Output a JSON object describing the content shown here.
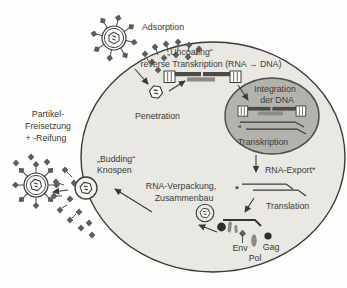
{
  "diagram": {
    "type": "retrovirus-replication-cycle",
    "labels": {
      "adsorption": "Adsorption",
      "uncoating": "„Uncoating“",
      "reverse_transcription": "reverse Transkription (RNA → DNA)",
      "penetration": "Penetration",
      "integration_line1": "Integration",
      "integration_line2": "der DNA",
      "transcription": "Transkription",
      "rna_export": "RNA-Export*",
      "translation": "Translation",
      "packaging_line1": "RNA-Verpackung,",
      "packaging_line2": "Zusammenbau",
      "budding_line1": "„Budding“",
      "budding_line2": "Knospen",
      "release_line1": "Partikel-",
      "release_line2": "Freisetzung",
      "release_line3": "+ -Reifung",
      "protein_env": "Env",
      "protein_pol": "Pol",
      "protein_gag": "Gag"
    },
    "colors": {
      "ink": "#3a3a38",
      "cell_fill": "#e9e8e3",
      "nucleus_fill": "#b3b2ad",
      "spike_fill": "#5d5d5b",
      "protein_gray": "#8b8a86",
      "dark_protein": "#2f2f2d",
      "background": "#fdfdfb"
    }
  }
}
